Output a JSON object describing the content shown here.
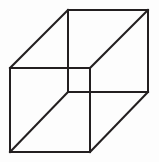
{
  "figure": {
    "name": "necker-cube",
    "caption": "",
    "background_color": "#fdfdfd",
    "stroke_color": "#231f20",
    "stroke_width": 2,
    "canvas": {
      "width": 159,
      "height": 162
    },
    "geometry": {
      "front_face": {
        "name": "front-square",
        "points": "10,68 90,68 90,152 10,152"
      },
      "back_face": {
        "name": "back-square",
        "points": "68,10 148,10 148,92 68,92"
      },
      "connectors": [
        {
          "name": "connector-top-left",
          "x1": 10,
          "y1": 68,
          "x2": 68,
          "y2": 10
        },
        {
          "name": "connector-top-right",
          "x1": 90,
          "y1": 68,
          "x2": 148,
          "y2": 10
        },
        {
          "name": "connector-bottom-right",
          "x1": 90,
          "y1": 152,
          "x2": 148,
          "y2": 92
        },
        {
          "name": "connector-bottom-left",
          "x1": 10,
          "y1": 152,
          "x2": 68,
          "y2": 92
        }
      ]
    }
  }
}
